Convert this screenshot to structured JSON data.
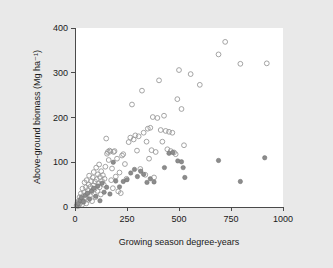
{
  "chart_data": {
    "type": "scatter",
    "title": "",
    "xlabel": "Growing season degree-years",
    "ylabel": "Above-ground biomass (Mg ha⁻¹)",
    "xlim": [
      0,
      1000
    ],
    "ylim": [
      0,
      400
    ],
    "xticks": [
      0,
      250,
      500,
      750,
      1000
    ],
    "yticks": [
      0,
      100,
      200,
      300,
      400
    ],
    "xtick_labels": [
      "0",
      "250",
      "500",
      "750",
      "1000"
    ],
    "ytick_labels": [
      "0",
      "100",
      "200",
      "300",
      "400"
    ],
    "grid": false,
    "legend": "none",
    "colors": {
      "open_marker_stroke": "#9a9a9a",
      "filled_marker_fill": "#8c8c8c",
      "axis": "#4a4a4a",
      "plot_background": "#ffffff",
      "figure_background": "#e9e9e9"
    },
    "series": [
      {
        "name": "open-circles",
        "marker": "open-circle",
        "points": [
          [
            8,
            4
          ],
          [
            12,
            10
          ],
          [
            14,
            2
          ],
          [
            18,
            14
          ],
          [
            20,
            6
          ],
          [
            22,
            22
          ],
          [
            26,
            9
          ],
          [
            28,
            30
          ],
          [
            32,
            17
          ],
          [
            34,
            5
          ],
          [
            36,
            41
          ],
          [
            38,
            24
          ],
          [
            42,
            12
          ],
          [
            44,
            33
          ],
          [
            46,
            55
          ],
          [
            48,
            20
          ],
          [
            52,
            44
          ],
          [
            54,
            8
          ],
          [
            56,
            60
          ],
          [
            58,
            29
          ],
          [
            62,
            38
          ],
          [
            64,
            16
          ],
          [
            66,
            50
          ],
          [
            68,
            70
          ],
          [
            72,
            26
          ],
          [
            74,
            45
          ],
          [
            78,
            58
          ],
          [
            80,
            34
          ],
          [
            82,
            13
          ],
          [
            86,
            66
          ],
          [
            88,
            48
          ],
          [
            90,
            78
          ],
          [
            94,
            40
          ],
          [
            96,
            57
          ],
          [
            98,
            22
          ],
          [
            102,
            88
          ],
          [
            104,
            62
          ],
          [
            108,
            36
          ],
          [
            110,
            73
          ],
          [
            112,
            52
          ],
          [
            116,
            95
          ],
          [
            118,
            44
          ],
          [
            120,
            67
          ],
          [
            124,
            28
          ],
          [
            126,
            80
          ],
          [
            130,
            58
          ],
          [
            134,
            71
          ],
          [
            138,
            50
          ],
          [
            142,
            63
          ],
          [
            146,
            90
          ],
          [
            150,
            153
          ],
          [
            154,
            119
          ],
          [
            158,
            123
          ],
          [
            162,
            105
          ],
          [
            166,
            126
          ],
          [
            170,
            124
          ],
          [
            174,
            60
          ],
          [
            178,
            86
          ],
          [
            182,
            42
          ],
          [
            186,
            123
          ],
          [
            190,
            125
          ],
          [
            196,
            68
          ],
          [
            202,
            108
          ],
          [
            208,
            35
          ],
          [
            214,
            77
          ],
          [
            220,
            31
          ],
          [
            226,
            115
          ],
          [
            232,
            118
          ],
          [
            240,
            96
          ],
          [
            248,
            63
          ],
          [
            258,
            145
          ],
          [
            266,
            155
          ],
          [
            274,
            229
          ],
          [
            282,
            151
          ],
          [
            290,
            160
          ],
          [
            298,
            126
          ],
          [
            306,
            158
          ],
          [
            314,
            85
          ],
          [
            322,
            260
          ],
          [
            330,
            166
          ],
          [
            338,
            72
          ],
          [
            344,
            146
          ],
          [
            350,
            175
          ],
          [
            356,
            108
          ],
          [
            362,
            177
          ],
          [
            368,
            127
          ],
          [
            374,
            201
          ],
          [
            380,
            66
          ],
          [
            388,
            123
          ],
          [
            396,
            199
          ],
          [
            404,
            283
          ],
          [
            412,
            172
          ],
          [
            420,
            146
          ],
          [
            428,
            204
          ],
          [
            436,
            170
          ],
          [
            444,
            129
          ],
          [
            452,
            168
          ],
          [
            460,
            125
          ],
          [
            468,
            166
          ],
          [
            476,
            122
          ],
          [
            484,
            118
          ],
          [
            492,
            241
          ],
          [
            500,
            306
          ],
          [
            512,
            219
          ],
          [
            524,
            138
          ],
          [
            556,
            297
          ],
          [
            600,
            273
          ],
          [
            690,
            341
          ],
          [
            722,
            369
          ],
          [
            795,
            320
          ],
          [
            922,
            321
          ]
        ]
      },
      {
        "name": "filled-circles",
        "marker": "filled-circle",
        "points": [
          [
            10,
            3
          ],
          [
            16,
            8
          ],
          [
            24,
            15
          ],
          [
            30,
            21
          ],
          [
            40,
            12
          ],
          [
            50,
            26
          ],
          [
            60,
            31
          ],
          [
            70,
            18
          ],
          [
            80,
            36
          ],
          [
            90,
            42
          ],
          [
            100,
            24
          ],
          [
            110,
            47
          ],
          [
            120,
            14
          ],
          [
            130,
            53
          ],
          [
            140,
            33
          ],
          [
            152,
            44
          ],
          [
            168,
            29
          ],
          [
            184,
            100
          ],
          [
            196,
            58
          ],
          [
            214,
            45
          ],
          [
            232,
            57
          ],
          [
            250,
            61
          ],
          [
            268,
            76
          ],
          [
            286,
            84
          ],
          [
            300,
            68
          ],
          [
            316,
            80
          ],
          [
            330,
            73
          ],
          [
            346,
            55
          ],
          [
            362,
            63
          ],
          [
            380,
            56
          ],
          [
            430,
            88
          ],
          [
            452,
            120
          ],
          [
            470,
            122
          ],
          [
            494,
            103
          ],
          [
            512,
            101
          ],
          [
            520,
            88
          ],
          [
            528,
            66
          ],
          [
            690,
            104
          ],
          [
            795,
            57
          ],
          [
            912,
            110
          ]
        ]
      }
    ]
  },
  "figure": {
    "caption": ""
  }
}
